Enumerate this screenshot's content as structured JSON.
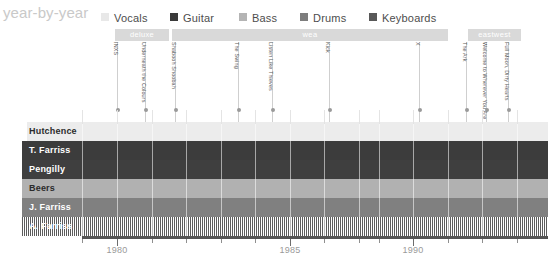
{
  "header": {
    "title": "year-by-year",
    "legend": [
      {
        "label": "Vocals",
        "color": "#e8e8e8",
        "x": 101
      },
      {
        "label": "Guitar",
        "color": "#3a3a3a",
        "x": 170
      },
      {
        "label": "Bass",
        "color": "#b4b4b4",
        "x": 239
      },
      {
        "label": "Drums",
        "color": "#7d7d7d",
        "x": 300
      },
      {
        "label": "Keyboards",
        "color": "#585858",
        "x": 369
      }
    ]
  },
  "record_labels": [
    {
      "name": "deluxe",
      "left": 115,
      "width": 54,
      "color": "#d9d9d9"
    },
    {
      "name": "wea",
      "left": 172,
      "width": 276,
      "color": "#d9d9d9"
    },
    {
      "name": "eastwest",
      "left": 468,
      "width": 53,
      "color": "#d9d9d9"
    }
  ],
  "albums": [
    {
      "name": "INXS",
      "x": 117
    },
    {
      "name": "Underneath the Colours",
      "x": 145
    },
    {
      "name": "Shabooh Shoobah",
      "x": 175
    },
    {
      "name": "The Swing",
      "x": 238
    },
    {
      "name": "Listen Like Thieves",
      "x": 272
    },
    {
      "name": "Kick",
      "x": 329
    },
    {
      "name": "X",
      "x": 419
    },
    {
      "name": "The Ark",
      "x": 466
    },
    {
      "name": "Welcome to Wherever You Are",
      "x": 486
    },
    {
      "name": "Full Moon, Dirty Hearts",
      "x": 508
    }
  ],
  "members": [
    {
      "name": "Hutchence",
      "role": "Vocals",
      "color": "#ececec",
      "text_color": "#2b2b2b",
      "start": 27,
      "striped": false
    },
    {
      "name": "T. Farriss",
      "role": "Guitar",
      "color": "#3c3c3c",
      "text_color": "#ffffff",
      "start": 22,
      "striped": false
    },
    {
      "name": "Pengilly",
      "role": "Guitar",
      "color": "#3f3f3f",
      "text_color": "#ffffff",
      "start": 22,
      "striped": false
    },
    {
      "name": "Beers",
      "role": "Bass",
      "color": "#b1b1b1",
      "text_color": "#2b2b2b",
      "start": 22,
      "striped": false
    },
    {
      "name": "J. Farriss",
      "role": "Drums",
      "color": "#808080",
      "text_color": "#ffffff",
      "start": 22,
      "striped": false
    },
    {
      "name": "A. Farriss",
      "role": "Keyboards",
      "color": "#5c5c5c",
      "text_color": "#ffffff",
      "start": 22,
      "striped": true
    }
  ],
  "axis": {
    "labels": [
      {
        "text": "1980",
        "x": 117
      },
      {
        "text": "1985",
        "x": 290
      },
      {
        "text": "1990",
        "x": 413
      }
    ],
    "major_ticks": [
      117,
      290,
      413
    ],
    "minor_ticks": [
      82,
      117,
      152,
      186,
      221,
      255,
      290,
      324,
      359,
      379,
      413,
      448,
      482,
      517
    ]
  },
  "chart_data": {
    "type": "bar",
    "title": "year-by-year",
    "xlabel": "",
    "ylabel": "",
    "xlim": [
      1978.0,
      1994.5
    ],
    "grid": true,
    "legend_position": "top",
    "categories": [
      "Hutchence",
      "T. Farriss",
      "Pengilly",
      "Beers",
      "J. Farriss",
      "A. Farriss"
    ],
    "series": [
      {
        "name": "Hutchence",
        "role": "Vocals",
        "start_year": 1977,
        "end_year": 1994.5
      },
      {
        "name": "T. Farriss",
        "role": "Guitar",
        "start_year": 1977,
        "end_year": 1994.5
      },
      {
        "name": "Pengilly",
        "role": "Guitar",
        "start_year": 1977,
        "end_year": 1994.5
      },
      {
        "name": "Beers",
        "role": "Bass",
        "start_year": 1977,
        "end_year": 1994.5
      },
      {
        "name": "J. Farriss",
        "role": "Drums",
        "start_year": 1977,
        "end_year": 1994.5
      },
      {
        "name": "A. Farriss",
        "role": "Keyboards",
        "start_year": 1977,
        "end_year": 1994.5
      }
    ],
    "annotations": {
      "albums": [
        "INXS",
        "Underneath the Colours",
        "Shabooh Shoobah",
        "The Swing",
        "Listen Like Thieves",
        "Kick",
        "X",
        "The Ark",
        "Welcome to Wherever You Are",
        "Full Moon, Dirty Hearts"
      ],
      "record_labels": [
        "deluxe",
        "wea",
        "eastwest"
      ]
    }
  }
}
